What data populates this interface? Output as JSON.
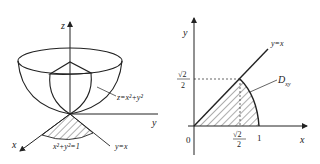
{
  "left_figure": {
    "axis_z": "z",
    "axis_y": "y",
    "axis_x": "x",
    "surface_label": "z=x²+y²",
    "circle_label": "x²+y²=1",
    "line_label": "y=x"
  },
  "right_figure": {
    "axis_y": "y",
    "axis_x": "x",
    "origin": "0",
    "line_label": "y=x",
    "region_label": "D",
    "region_subscript": "xy",
    "tick_x1": "1",
    "tick_sqrt2_num": "√2",
    "tick_sqrt2_den": "2",
    "ytick_sqrt2_num": "√2",
    "ytick_sqrt2_den": "2"
  },
  "colors": {
    "stroke": "#222222",
    "background": "#ffffff"
  }
}
